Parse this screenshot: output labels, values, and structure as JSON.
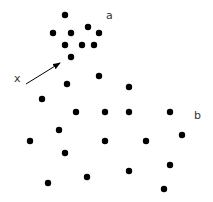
{
  "diagram": {
    "labels": [
      {
        "text": "a",
        "x": 106,
        "y": 10
      },
      {
        "text": "x",
        "x": 14,
        "y": 73
      },
      {
        "text": "b",
        "x": 194,
        "y": 110
      }
    ],
    "point_radius": 3.2,
    "point_color": "#000000",
    "points": [
      [
        65,
        15
      ],
      [
        88,
        27
      ],
      [
        53,
        33
      ],
      [
        71,
        33
      ],
      [
        99,
        33
      ],
      [
        65,
        45
      ],
      [
        82,
        45
      ],
      [
        94,
        45
      ],
      [
        71,
        57
      ],
      [
        99,
        76
      ],
      [
        67,
        84
      ],
      [
        129,
        87
      ],
      [
        42,
        99
      ],
      [
        76,
        112
      ],
      [
        105,
        112
      ],
      [
        129,
        112
      ],
      [
        170,
        112
      ],
      [
        59,
        130
      ],
      [
        182,
        135
      ],
      [
        30,
        141
      ],
      [
        105,
        141
      ],
      [
        146,
        141
      ],
      [
        65,
        153
      ],
      [
        170,
        165
      ],
      [
        129,
        171
      ],
      [
        87,
        177
      ],
      [
        48,
        183
      ],
      [
        164,
        189
      ]
    ],
    "arrow": {
      "x1": 26,
      "y1": 84,
      "x2": 60,
      "y2": 63,
      "color": "#000000"
    }
  }
}
